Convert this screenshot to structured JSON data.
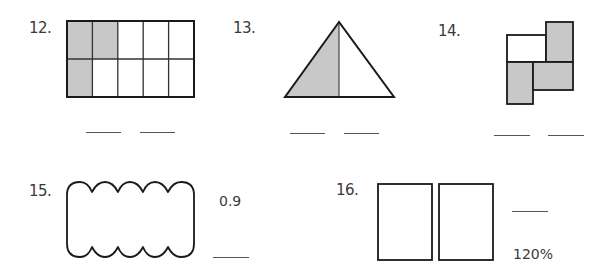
{
  "problems": [
    {
      "number": "12.",
      "figure": "rectangle-grid",
      "grid": {
        "rows": 2,
        "cols": 5,
        "shaded_cells": [
          [
            0,
            0
          ],
          [
            0,
            1
          ],
          [
            1,
            0
          ]
        ]
      },
      "blanks": 2
    },
    {
      "number": "13.",
      "figure": "triangle-split",
      "parts": 2,
      "shaded_parts": 1,
      "blanks": 2
    },
    {
      "number": "14.",
      "figure": "composite-rectangles",
      "parts": 4,
      "shaded_parts": 3,
      "blanks": 2
    },
    {
      "number": "15.",
      "figure": "scalloped-rectangle",
      "given_value": "0.9",
      "blanks": 1
    },
    {
      "number": "16.",
      "figure": "two-rectangles",
      "given_value": "120%",
      "blanks": 1
    }
  ],
  "colors": {
    "shade": "#c8c8c8",
    "stroke": "#1a1a1a",
    "text": "#3a3a3a"
  }
}
